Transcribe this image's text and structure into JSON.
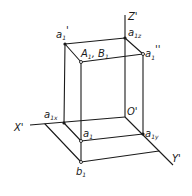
{
  "diagram": {
    "type": "axonometric-projection",
    "axes": {
      "x": {
        "label": "X'"
      },
      "y": {
        "label": "Y'"
      },
      "z": {
        "label": "Z'"
      },
      "origin": {
        "label": "O'"
      }
    },
    "points": [
      {
        "id": "a1_prime",
        "base": "a",
        "sub": "1",
        "mark": "'"
      },
      {
        "id": "a1z",
        "base": "a",
        "sub": "1z",
        "mark": ""
      },
      {
        "id": "A1B1",
        "text": "A",
        "sub": "1",
        "text2": ", B",
        "sub2": "1"
      },
      {
        "id": "a1_dprime",
        "base": "a",
        "sub": "1",
        "mark": "''"
      },
      {
        "id": "a1x",
        "base": "a",
        "sub": "1x",
        "mark": ""
      },
      {
        "id": "a1",
        "base": "a",
        "sub": "1",
        "mark": ""
      },
      {
        "id": "a1y",
        "base": "a",
        "sub": "1y",
        "mark": ""
      },
      {
        "id": "b1",
        "base": "b",
        "sub": "1",
        "mark": ""
      }
    ],
    "colors": {
      "ink": "#1a1a1a",
      "background": "#ffffff"
    }
  }
}
